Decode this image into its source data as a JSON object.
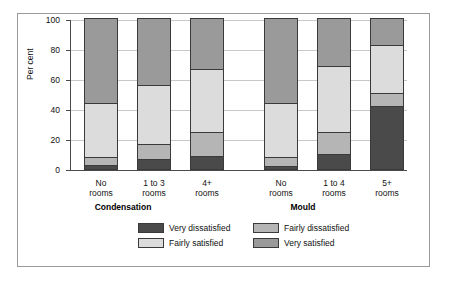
{
  "chart_data": {
    "type": "bar",
    "stacked": true,
    "title": "",
    "xlabel": "",
    "ylabel": "Per cent",
    "ylim": [
      0,
      100
    ],
    "yticks": [
      0,
      20,
      40,
      60,
      80,
      100
    ],
    "ytick_labels": [
      "0",
      "20",
      "40",
      "60",
      "80",
      "100"
    ],
    "grid": true,
    "legend_position": "bottom",
    "groups": [
      {
        "name": "Condensation",
        "categories": [
          "No\nrooms",
          "1 to 3\nrooms",
          "4+\nrooms"
        ]
      },
      {
        "name": "Mould",
        "categories": [
          "No\nrooms",
          "1 to 4\nrooms",
          "5+\nrooms"
        ]
      }
    ],
    "categories": [
      "No rooms",
      "1 to 3 rooms",
      "4+ rooms",
      "No rooms",
      "1 to 4 rooms",
      "5+ rooms"
    ],
    "series": [
      {
        "name": "Very dissatisfied",
        "color": "#4a4a4a",
        "values": [
          3,
          7,
          9,
          2,
          10,
          42
        ]
      },
      {
        "name": "Fairly dissatisfied",
        "color": "#b5b5b5",
        "values": [
          5,
          10,
          16,
          6,
          15,
          9
        ]
      },
      {
        "name": "Fairly satisfied",
        "color": "#dcdcdc",
        "values": [
          36,
          39,
          42,
          36,
          44,
          32
        ]
      },
      {
        "name": "Very satisfied",
        "color": "#9a9a9a",
        "values": [
          56,
          44,
          33,
          56,
          31,
          17
        ]
      }
    ]
  },
  "axis": {
    "y_label": "Per cent",
    "y_ticks": [
      "100",
      "80",
      "60",
      "40",
      "20",
      "0"
    ]
  },
  "bars": [
    {
      "label_line1": "No",
      "label_line2": "rooms",
      "vs": 56,
      "fs": 36,
      "fd": 5,
      "vd": 3
    },
    {
      "label_line1": "1 to 3",
      "label_line2": "rooms",
      "vs": 44,
      "fs": 39,
      "fd": 10,
      "vd": 7
    },
    {
      "label_line1": "4+",
      "label_line2": "rooms",
      "vs": 33,
      "fs": 42,
      "fd": 16,
      "vd": 9
    },
    {
      "label_line1": "No",
      "label_line2": "rooms",
      "vs": 56,
      "fs": 36,
      "fd": 6,
      "vd": 2
    },
    {
      "label_line1": "1 to 4",
      "label_line2": "rooms",
      "vs": 31,
      "fs": 44,
      "fd": 15,
      "vd": 10
    },
    {
      "label_line1": "5+",
      "label_line2": "rooms",
      "vs": 17,
      "fs": 32,
      "fd": 9,
      "vd": 42
    }
  ],
  "groups": {
    "condensation": "Condensation",
    "mould": "Mould"
  },
  "legend": {
    "very_dissatisfied": "Very dissatisfied",
    "fairly_dissatisfied": "Fairly dissatisfied",
    "fairly_satisfied": "Fairly satisfied",
    "very_satisfied": "Very satisfied"
  },
  "colors": {
    "very_dissatisfied": "#4a4a4a",
    "fairly_dissatisfied": "#b5b5b5",
    "fairly_satisfied": "#dcdcdc",
    "very_satisfied": "#9a9a9a",
    "grid": "#c9c9c9",
    "axis": "#4a4a4a",
    "border": "#9a9a9a"
  }
}
